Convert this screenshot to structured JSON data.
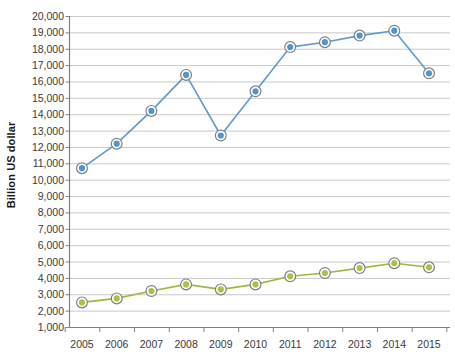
{
  "chart_data": {
    "type": "line",
    "title": "",
    "xlabel": "",
    "ylabel": "Billion US dollar",
    "x": [
      2005,
      2006,
      2007,
      2008,
      2009,
      2010,
      2011,
      2012,
      2013,
      2014,
      2015
    ],
    "categories": [
      "2005",
      "2006",
      "2007",
      "2008",
      "2009",
      "2010",
      "2011",
      "2012",
      "2013",
      "2014",
      "2015"
    ],
    "series": [
      {
        "name": "blue-series",
        "color": "#5b9bd5",
        "marker_fill": "#4f96d0",
        "marker_ring": "#808080",
        "values": [
          10700,
          12200,
          14200,
          16400,
          12700,
          15400,
          18100,
          18400,
          18800,
          19100,
          16500
        ]
      },
      {
        "name": "green-series",
        "color": "#9bbb3c",
        "marker_fill": "#aac147",
        "marker_ring": "#808080",
        "values": [
          2500,
          2750,
          3200,
          3600,
          3300,
          3600,
          4100,
          4300,
          4600,
          4900,
          4650
        ]
      }
    ],
    "ylim": [
      1000,
      20000
    ],
    "ytick_step": 1000,
    "yticks": [
      1000,
      2000,
      3000,
      4000,
      5000,
      6000,
      7000,
      8000,
      9000,
      10000,
      11000,
      12000,
      13000,
      14000,
      15000,
      16000,
      17000,
      18000,
      19000,
      20000
    ],
    "ytick_labels": [
      "1,000",
      "2,000",
      "3,000",
      "4,000",
      "5,000",
      "6,000",
      "7,000",
      "8,000",
      "9,000",
      "10,000",
      "11,000",
      "12,000",
      "13,000",
      "14,000",
      "15,000",
      "16,000",
      "17,000",
      "18,000",
      "19,000",
      "20,000"
    ],
    "grid": true,
    "grid_color": "#c9c9c9",
    "axis_color": "#808080",
    "legend": "none",
    "legend_position": "none",
    "background": "#ffffff"
  }
}
